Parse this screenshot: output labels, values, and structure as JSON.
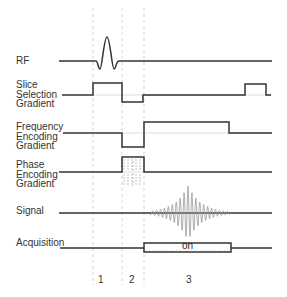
{
  "diagram": {
    "rows": [
      {
        "id": "rf",
        "label": "RF"
      },
      {
        "id": "slice",
        "label": "Slice\nSelection\nGradient"
      },
      {
        "id": "frequency",
        "label": "Frequency\nEncoding\nGradient"
      },
      {
        "id": "phase",
        "label": "Phase\nEncoding\nGradient"
      },
      {
        "id": "signal",
        "label": "Signal"
      },
      {
        "id": "acquisition",
        "label": "Acquisition"
      }
    ],
    "acquisition_state": "on",
    "intervals": [
      "1",
      "2",
      "3"
    ],
    "colors": {
      "trace": "#333333",
      "guide": "#bbbbbb",
      "signal": "#999999",
      "text": "#333333"
    }
  }
}
